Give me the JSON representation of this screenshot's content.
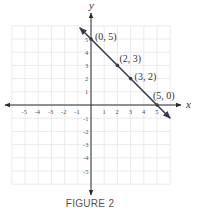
{
  "chart_data": {
    "type": "line",
    "title": "",
    "caption": "FIGURE 2",
    "xlabel": "x",
    "ylabel": "y",
    "xlim": [
      -6,
      6
    ],
    "ylim": [
      -6,
      6
    ],
    "grid": true,
    "x_ticks": [
      -5,
      -4,
      -3,
      -2,
      -1,
      1,
      2,
      3,
      4,
      5
    ],
    "y_ticks": [
      5,
      4,
      3,
      2,
      1,
      -1,
      -2,
      -3,
      -4,
      -5
    ],
    "series": [
      {
        "name": "line",
        "equation": "y = -x + 5",
        "points": [
          {
            "x": 0,
            "y": 5,
            "label": "(0, 5)"
          },
          {
            "x": 2,
            "y": 3,
            "label": "(2, 3)"
          },
          {
            "x": 3,
            "y": 2,
            "label": "(3, 2)"
          },
          {
            "x": 5,
            "y": 0,
            "label": "(5, 0)"
          }
        ]
      }
    ]
  },
  "colors": {
    "line": "#3a3a4a",
    "axis": "#2a2a2a",
    "grid": "#e6e6e6"
  }
}
